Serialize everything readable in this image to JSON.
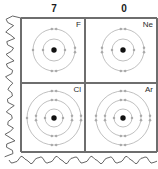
{
  "figure": {
    "kind": "periodic-table-fragment",
    "torn_edges": [
      "left",
      "bottom"
    ],
    "colors": {
      "paper": "#ffffff",
      "grid_line": "#6e6e6e",
      "ring": "#b9b9b9",
      "electron": "#a9a9a9",
      "nucleus": "#111111",
      "text": "#1a1a1a"
    }
  },
  "column_headers": [
    {
      "label": "7",
      "x": 54
    },
    {
      "label": "0",
      "x": 124
    }
  ],
  "cells": [
    {
      "symbol": "F",
      "group": "7",
      "row": 0,
      "col": 0,
      "shells": [
        2,
        7
      ],
      "cx": 54,
      "cy": 50,
      "ring_radii": [
        11,
        21
      ]
    },
    {
      "symbol": "Ne",
      "group": "0",
      "row": 0,
      "col": 1,
      "shells": [
        2,
        8
      ],
      "cx": 123,
      "cy": 50,
      "ring_radii": [
        11,
        21
      ]
    },
    {
      "symbol": "Cl",
      "group": "7",
      "row": 1,
      "col": 0,
      "shells": [
        2,
        8,
        7
      ],
      "cx": 54,
      "cy": 118,
      "ring_radii": [
        9,
        18,
        27
      ]
    },
    {
      "symbol": "Ar",
      "group": "0",
      "row": 1,
      "col": 1,
      "shells": [
        2,
        8,
        8
      ],
      "cx": 123,
      "cy": 118,
      "ring_radii": [
        9,
        18,
        27
      ]
    }
  ],
  "grid": {
    "left": 21,
    "right": 157,
    "top": 18,
    "bottom": 152,
    "mid_x": 85,
    "mid_y": 83
  }
}
